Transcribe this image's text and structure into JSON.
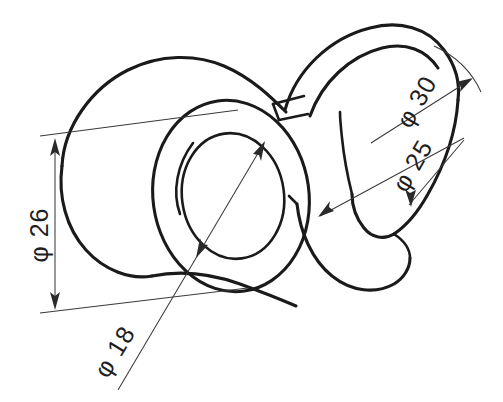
{
  "drawing": {
    "title": "Isometric part drawing with diameter dimensions",
    "background_color": "#ffffff",
    "line_color": "#1a1a1a",
    "dimension_color": "#3a3a3a",
    "units": "mm"
  },
  "dimensions": [
    {
      "id": "dia-26",
      "label": "φ 26",
      "symbol": "φ",
      "value": "26",
      "name": "outer-cylinder-diameter",
      "orientation": "vertical",
      "rotation_deg": -90,
      "text_x": 48,
      "text_y": 235,
      "placement": "left"
    },
    {
      "id": "dia-18",
      "label": "φ 18",
      "symbol": "φ",
      "value": "18",
      "name": "bore-diameter",
      "orientation": "diagonal",
      "rotation_deg": -58,
      "text_x": 122,
      "text_y": 356,
      "placement": "lower-left"
    },
    {
      "id": "dia-30",
      "label": "φ 30",
      "symbol": "φ",
      "value": "30",
      "name": "crescent-outer-diameter",
      "orientation": "diagonal",
      "rotation_deg": -62,
      "text_x": 422,
      "text_y": 108,
      "placement": "upper-right"
    },
    {
      "id": "dia-25",
      "label": "φ 25",
      "symbol": "φ",
      "value": "25",
      "name": "crescent-inner-diameter",
      "orientation": "diagonal",
      "rotation_deg": -62,
      "text_x": 420,
      "text_y": 172,
      "placement": "right"
    }
  ],
  "features": {
    "left_cylinder": "cylindrical-boss",
    "center_ring": "annular-face-with-bore",
    "right_crescent": "c-shaped-curved-flange",
    "neck": "connecting-web"
  }
}
